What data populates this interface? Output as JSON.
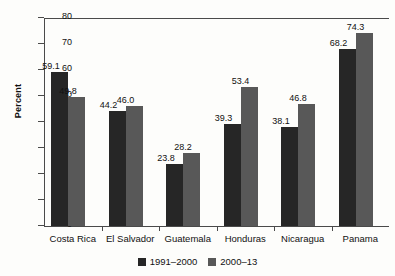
{
  "chart_data": {
    "type": "bar",
    "title": "",
    "xlabel": "",
    "ylabel": "Percent",
    "ylim": [
      0,
      80
    ],
    "yticks": [
      0,
      10,
      20,
      30,
      40,
      50,
      60,
      70,
      80
    ],
    "grid": false,
    "legend_position": "bottom-center",
    "categories": [
      "Costa Rica",
      "El Salvador",
      "Guatemala",
      "Honduras",
      "Nicaragua",
      "Panama"
    ],
    "series": [
      {
        "name": "1991–2000",
        "color": "#262626",
        "values": [
          59.1,
          44.2,
          23.8,
          39.3,
          38.1,
          68.2
        ],
        "labels": [
          "59.1",
          "44.2",
          "23.8",
          "39.3",
          "38.1",
          "68.2"
        ]
      },
      {
        "name": "2000–13",
        "color": "#585858",
        "values": [
          49.8,
          46.0,
          28.2,
          53.4,
          46.8,
          74.3
        ],
        "labels": [
          "49.8",
          "46.0",
          "28.2",
          "53.4",
          "46.8",
          "74.3"
        ]
      }
    ],
    "ytick_labels": [
      "0",
      "10",
      "20",
      "30",
      "40",
      "50",
      "60",
      "70",
      "80"
    ]
  }
}
